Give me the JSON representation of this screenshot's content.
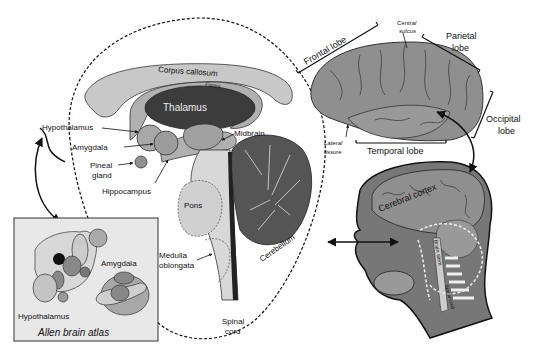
{
  "limbic": {
    "corpus_callosum": "Corpus callosum",
    "fornix": "Fornix",
    "thalamus": "Thalamus",
    "hypothalamus": "Hypothalamus",
    "amygdala": "Amygdala",
    "pineal_1": "Pineal",
    "pineal_2": "gland",
    "hippocampus": "Hippocampus",
    "midbrain": "Midbrain",
    "pons": "Pons",
    "medulla_1": "Medulla",
    "medulla_2": "oblongata",
    "spinal_1": "Spinal",
    "spinal_2": "cord",
    "cerebellum": "Cerebellum"
  },
  "cortex": {
    "frontal": "Frontal lobe",
    "central_1": "Central",
    "central_2": "sulcus",
    "parietal_1": "Parietal",
    "parietal_2": "lobe",
    "occipital_1": "Occipital",
    "occipital_2": "lobe",
    "lateral_1": "Lateral",
    "lateral_2": "fissure",
    "temporal": "Temporal lobe"
  },
  "head": {
    "cerebral_cortex": "Cerebral cortex",
    "brain_stem": "Brain stem",
    "spinal_cord": "Spinal cord"
  },
  "atlas": {
    "title": "Allen brain atlas",
    "amygdala": "Amygdala",
    "hypothalamus": "Hypothalamus"
  },
  "colors": {
    "light_gray": "#c8c8c8",
    "mid_gray": "#9a9a9a",
    "dark_gray": "#4a4a4a",
    "cortex_gray": "#8f8f8f"
  }
}
